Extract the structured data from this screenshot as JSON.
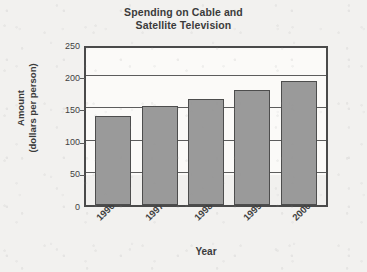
{
  "chart_data": {
    "type": "bar",
    "title": "Spending on Cable and Satellite Television",
    "title_line1": "Spending on Cable and",
    "title_line2": "Satellite Television",
    "xlabel": "Year",
    "ylabel": "Amount (dollars per person)",
    "ylabel_line1": "Amount",
    "ylabel_line2": "(dollars per person)",
    "categories": [
      "1996",
      "1997",
      "1998",
      "1999",
      "2000"
    ],
    "values": [
      138,
      153,
      165,
      179,
      192
    ],
    "ylim": [
      0,
      250
    ],
    "ytick_labels": [
      "0",
      "50",
      "100",
      "150",
      "200",
      "250"
    ],
    "ytick_values": [
      0,
      50,
      100,
      150,
      200,
      250
    ],
    "gridlines": [
      50,
      100,
      150,
      200
    ],
    "grid": true,
    "legend": null,
    "series": [
      {
        "name": "Spending per person",
        "values": [
          138,
          153,
          165,
          179,
          192
        ]
      }
    ]
  },
  "style": {
    "bar_fill": "#9a9a9a",
    "bar_border": "#4d4d4d",
    "axis_color": "#4a4a4a",
    "grid_color": "#5c5c5c",
    "text_color": "#3b3b3b",
    "plot_background": "#fbfaf8",
    "page_background": "#f2f1ef"
  }
}
